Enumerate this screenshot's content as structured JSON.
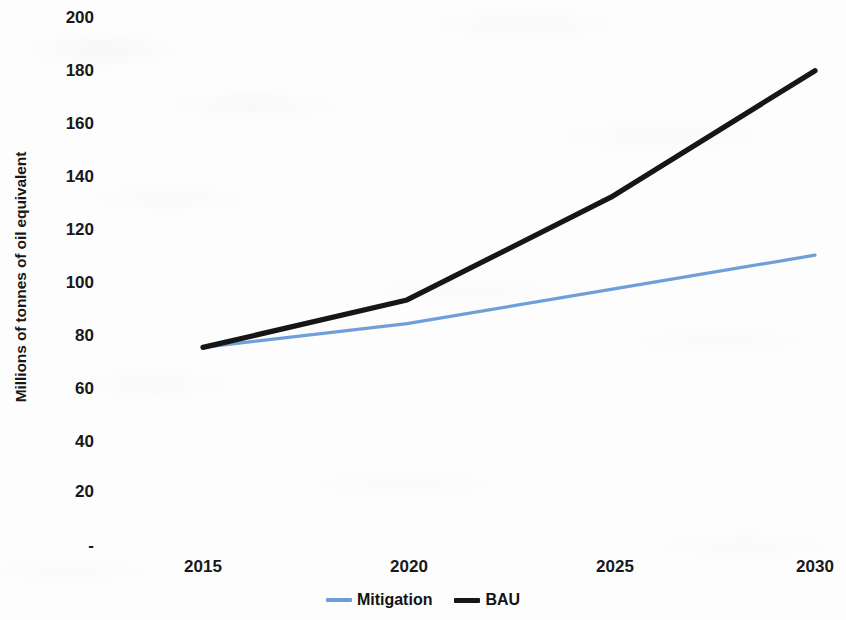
{
  "chart_data": {
    "type": "line",
    "title": "",
    "subtitle": "",
    "xlabel": "",
    "ylabel": "Millions of tonnes of oil equivalent",
    "x": [
      2015,
      2020,
      2025,
      2030
    ],
    "xtick_labels": [
      "2015",
      "2020",
      "2025",
      "2030"
    ],
    "ytick_labels": [
      "-",
      "20",
      "40",
      "60",
      "80",
      "100",
      "120",
      "140",
      "160",
      "180",
      "200"
    ],
    "ytick_values": [
      0,
      20,
      40,
      60,
      80,
      100,
      120,
      140,
      160,
      180,
      200
    ],
    "ylim": [
      0,
      200
    ],
    "xlim": [
      2015,
      2030
    ],
    "grid": false,
    "legend_position": "bottom",
    "series": [
      {
        "name": "Mitigation",
        "color": "#6f9fd8",
        "line_width": 3,
        "values": [
          75,
          84,
          97,
          110
        ]
      },
      {
        "name": "BAU",
        "color": "#161616",
        "line_width": 5,
        "values": [
          75,
          93,
          132,
          180
        ]
      }
    ]
  },
  "axes": {
    "y_title": "Millions of tonnes of oil equivalent",
    "y_ticks": [
      {
        "label": "200",
        "value": 200
      },
      {
        "label": "180",
        "value": 180
      },
      {
        "label": "160",
        "value": 160
      },
      {
        "label": "140",
        "value": 140
      },
      {
        "label": "120",
        "value": 120
      },
      {
        "label": "100",
        "value": 100
      },
      {
        "label": "80",
        "value": 80
      },
      {
        "label": "60",
        "value": 60
      },
      {
        "label": "40",
        "value": 40
      },
      {
        "label": "20",
        "value": 20
      },
      {
        "label": "-",
        "value": 0
      }
    ],
    "x_ticks": [
      {
        "label": "2015",
        "value": 2015
      },
      {
        "label": "2020",
        "value": 2020
      },
      {
        "label": "2025",
        "value": 2025
      },
      {
        "label": "2030",
        "value": 2030
      }
    ]
  },
  "legend": {
    "entries": [
      {
        "label": "Mitigation",
        "color": "#6f9fd8"
      },
      {
        "label": "BAU",
        "color": "#161616"
      }
    ]
  }
}
